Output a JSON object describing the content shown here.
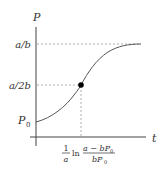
{
  "diagram": {
    "type": "logistic-growth-curve",
    "axes": {
      "y_label": "P",
      "x_label": "t"
    },
    "y_ticks": [
      {
        "label_main": "a/b",
        "meaning": "carrying capacity asymptote"
      },
      {
        "label_main": "a/2b",
        "meaning": "inflection point value"
      },
      {
        "label_main": "P",
        "label_sub": "0",
        "meaning": "initial population"
      }
    ],
    "x_tick": {
      "coef_num": "1",
      "coef_den": "a",
      "ln": "ln",
      "num": "a − bP",
      "num_sub": "0",
      "den": "bP",
      "den_sub": "0"
    },
    "inflection_point": {
      "x_label": "(1/a) ln((a − bP0)/(bP0))",
      "y_label": "a/2b"
    },
    "colors": {
      "axis": "#444444",
      "curve": "#555555",
      "dashed": "#999999",
      "point": "#000000",
      "text": "#333333"
    }
  }
}
